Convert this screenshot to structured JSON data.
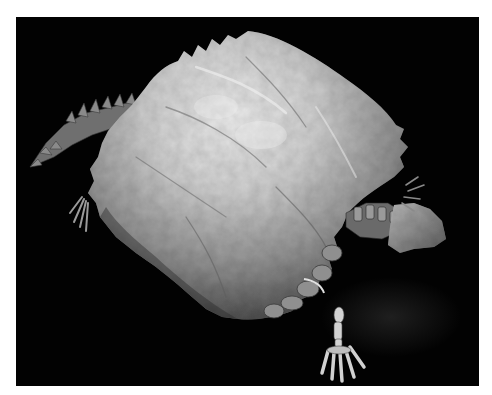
{
  "image": {
    "subject": "fossil turtle shell on black background",
    "frame": {
      "background": "#ffffff",
      "photo_background": "#020202"
    },
    "parts": [
      {
        "name": "carapace",
        "description": "large domed fossil shell with scalloped rim"
      },
      {
        "name": "tail",
        "description": "spiked bony tail extending to the upper left"
      },
      {
        "name": "left-hind-foot",
        "description": "small clawed foot at left edge"
      },
      {
        "name": "neck",
        "description": "bony neck vertebrae at right"
      },
      {
        "name": "head-block",
        "description": "rock fragment with skull at right"
      },
      {
        "name": "front-foot",
        "description": "skeletal foot with long toes at bottom center"
      },
      {
        "name": "right-claws",
        "description": "claw fragments at upper right"
      }
    ],
    "colors": {
      "shell_light": "#e6e6e6",
      "shell_mid": "#a9a9a9",
      "shell_dark": "#4a4a4a",
      "bone": "#c8c8c8",
      "shadow": "#1a1a1a"
    }
  }
}
